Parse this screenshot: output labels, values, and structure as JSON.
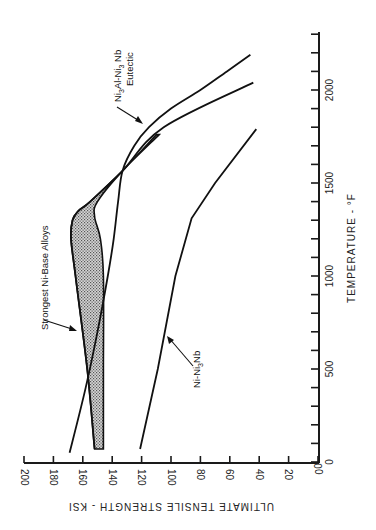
{
  "chart_data": {
    "type": "line",
    "orientation": "rotated 90 degrees (temperature runs vertically on right, strength runs horizontally along bottom, reversed)",
    "title": "",
    "xlabel": "TEMPERATURE - °F",
    "ylabel": "ULTIMATE TENSILE STRENGTH - KSI",
    "xlim": [
      0,
      2300
    ],
    "ylim": [
      0,
      200
    ],
    "x_ticks": [
      0,
      500,
      1000,
      1500,
      2000
    ],
    "x_minor_tick_step": 100,
    "y_ticks": [
      0,
      20,
      40,
      60,
      80,
      100,
      120,
      140,
      160,
      180,
      200
    ],
    "grid": false,
    "legend": "none (inline annotations)",
    "series": [
      {
        "name": "Ni3Al-Ni3Nb Eutectic",
        "label_lines": [
          "Ni3Al-Ni3 Nb",
          "Eutectic"
        ],
        "x": [
          50,
          400,
          700,
          1000,
          1200,
          1400,
          1565,
          1700,
          1800,
          1900,
          2000,
          2100,
          2190
        ],
        "values": [
          169,
          158,
          150,
          143,
          139,
          136,
          133,
          125,
          115,
          100,
          80,
          62,
          46
        ]
      },
      {
        "name": "Strongest Ni-Base Alloys (upper bound)",
        "x": [
          70,
          500,
          1000,
          1200,
          1300,
          1350,
          1400,
          1565,
          1800,
          2040
        ],
        "values": [
          152,
          157,
          165,
          168,
          167,
          163,
          155,
          133,
          105,
          44
        ]
      },
      {
        "name": "Strongest Ni-Base Alloys (lower bound)",
        "x": [
          70,
          500,
          1000,
          1200,
          1320,
          1400,
          1565,
          1760
        ],
        "values": [
          146,
          146,
          146,
          148,
          152,
          150,
          133,
          108
        ]
      },
      {
        "name": "Ni-Ni3Nb",
        "x": [
          70,
          500,
          1000,
          1310,
          1500,
          1790
        ],
        "values": [
          121,
          109,
          97,
          86,
          70,
          42
        ]
      }
    ],
    "shaded_band": "Strongest Ni-Base Alloys (region between upper and lower bound, stippled)",
    "annotations": [
      {
        "text": "Strongest Ni-Base Alloys",
        "points_to": "shaded band near 800°F, 160 ksi"
      },
      {
        "text": "Ni3Al-Ni3 Nb Eutectic",
        "points_to": "eutectic curve near 1850°F, 110 ksi"
      },
      {
        "text": "Ni-Ni3Nb",
        "points_to": "Ni-Ni3Nb curve near 800°F, 100 ksi"
      }
    ]
  },
  "labels": {
    "x_axis_title": "TEMPERATURE - °F",
    "y_axis_title": "ULTIMATE TENSILE STRENGTH - KSI",
    "strongest": "Strongest Ni-Base Alloys",
    "eutectic_line1": "Ni",
    "eutectic_line2": "Eutectic",
    "nb_label": "Ni-Ni"
  },
  "colors": {
    "ink": "#111111",
    "band_fill": "#b8b8b8",
    "background": "#ffffff"
  }
}
